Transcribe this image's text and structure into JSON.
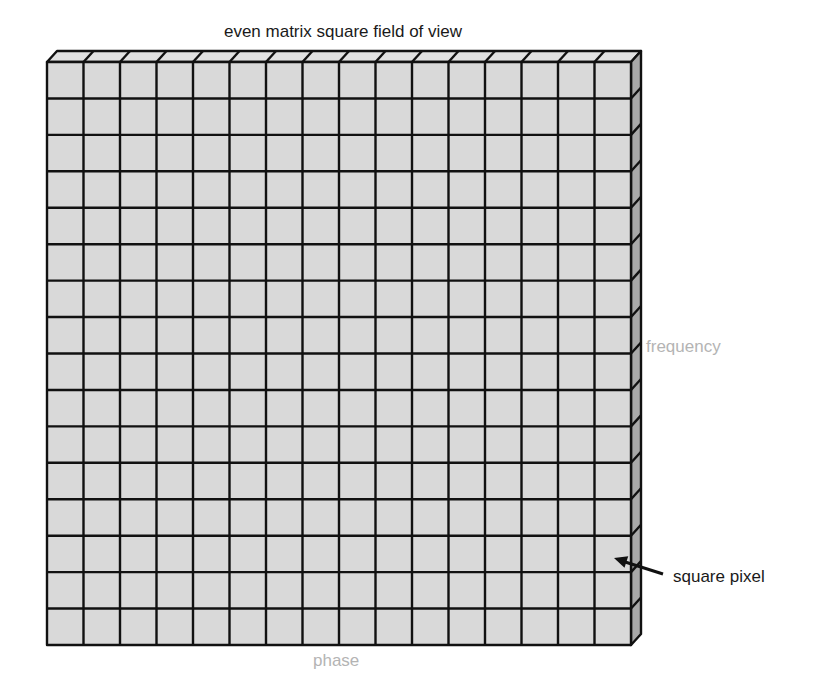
{
  "title": "even matrix square field of view",
  "axes": {
    "vertical_label": "frequency",
    "horizontal_label": "phase"
  },
  "annotation": {
    "label": "square pixel",
    "target": {
      "row": 14,
      "col": 16
    }
  },
  "grid": {
    "rows": 16,
    "cols": 16,
    "front_left": 47,
    "front_top": 62,
    "front_right": 631,
    "front_bottom": 645,
    "depth_dx": 10,
    "depth_dy": -11
  },
  "colors": {
    "front_face": "#d9d9d9",
    "top_face": "#e1e1e1",
    "side_face": "#a9a9a9",
    "grid_line": "#111111",
    "axis_label": "#b4b4b4",
    "text": "#1a1a1a"
  }
}
